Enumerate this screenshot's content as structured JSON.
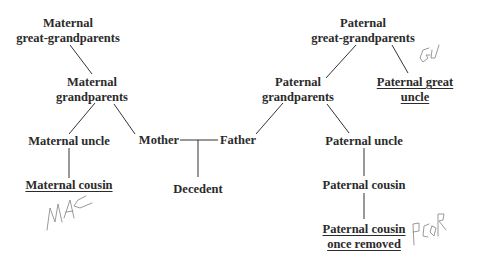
{
  "diagram": {
    "type": "family-tree",
    "nodes": {
      "maternal_great_grandparents": {
        "line1": "Maternal",
        "line2": "great-grandparents"
      },
      "maternal_grandparents": {
        "line1": "Maternal",
        "line2": "grandparents"
      },
      "maternal_uncle": {
        "label": "Maternal uncle"
      },
      "maternal_cousin": {
        "label": "Maternal cousin",
        "underlined": true
      },
      "mother": {
        "label": "Mother"
      },
      "father": {
        "label": "Father"
      },
      "decedent": {
        "label": "Decedent"
      },
      "paternal_great_grandparents": {
        "line1": "Paternal",
        "line2": "great-grandparents"
      },
      "paternal_grandparents": {
        "line1": "Paternal",
        "line2": "grandparents"
      },
      "paternal_great_uncle": {
        "line1": "Paternal great",
        "line2": "uncle",
        "underlined": true
      },
      "paternal_uncle": {
        "label": "Paternal uncle"
      },
      "paternal_cousin": {
        "label": "Paternal cousin"
      },
      "paternal_cousin_once_removed": {
        "line1": "Paternal cousin",
        "line2": "once removed",
        "underlined": true
      }
    },
    "edges": [
      [
        "maternal_great_grandparents",
        "maternal_grandparents"
      ],
      [
        "maternal_grandparents",
        "maternal_uncle"
      ],
      [
        "maternal_grandparents",
        "mother"
      ],
      [
        "maternal_uncle",
        "maternal_cousin"
      ],
      [
        "mother",
        "father"
      ],
      [
        "mother+father",
        "decedent"
      ],
      [
        "paternal_great_grandparents",
        "paternal_grandparents"
      ],
      [
        "paternal_great_grandparents",
        "paternal_great_uncle"
      ],
      [
        "paternal_grandparents",
        "father"
      ],
      [
        "paternal_grandparents",
        "paternal_uncle"
      ],
      [
        "paternal_uncle",
        "paternal_cousin"
      ],
      [
        "paternal_cousin",
        "paternal_cousin_once_removed"
      ]
    ],
    "annotations": {
      "maternal_cousin": "MAC",
      "paternal_great_uncle": "GU",
      "paternal_cousin_once_removed": "PCOR"
    },
    "colors": {
      "text": "#2b2b2b",
      "lines": "#333333",
      "handwriting": "#8a8a8a",
      "background": "#ffffff"
    }
  }
}
